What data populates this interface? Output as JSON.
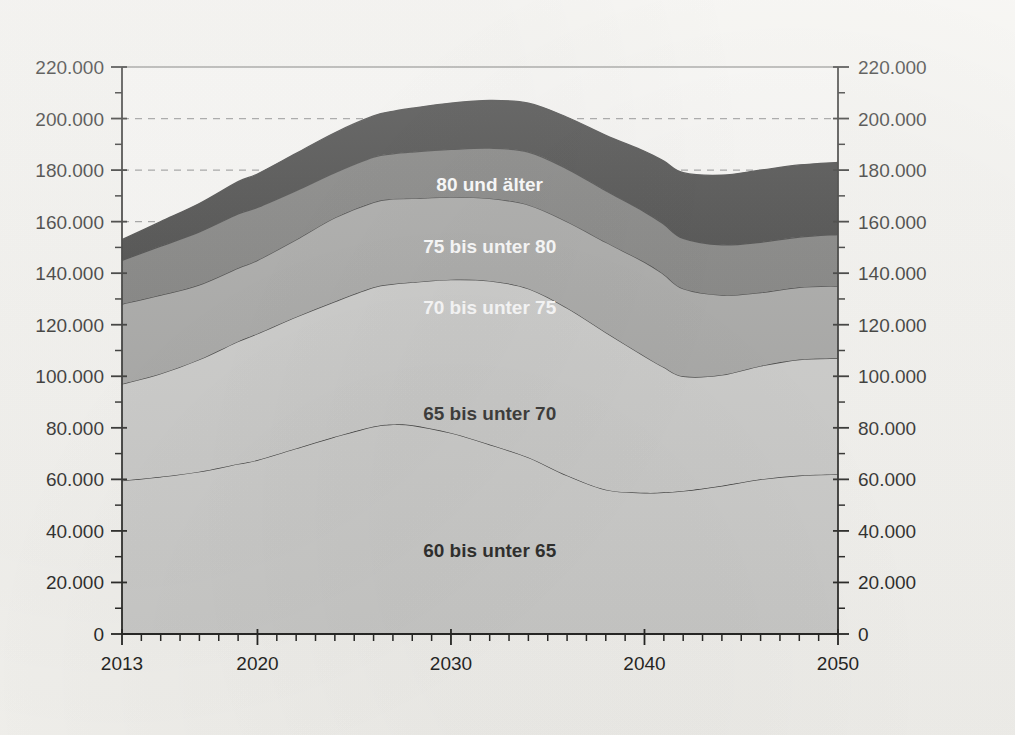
{
  "chart_data": {
    "type": "area",
    "stacked": true,
    "title": "",
    "subtitle": "",
    "xlabel": "",
    "ylabel": "",
    "xlim": [
      2013,
      2050
    ],
    "ylim": [
      0,
      220000
    ],
    "x_tick_labels": [
      "2013",
      "2020",
      "2030",
      "2040",
      "2050"
    ],
    "x_tick_values": [
      2013,
      2020,
      2030,
      2040,
      2050
    ],
    "x_minor_tick_step": 1,
    "y_tick_labels": [
      "0",
      "20.000",
      "40.000",
      "60.000",
      "80.000",
      "100.000",
      "120.000",
      "140.000",
      "160.000",
      "180.000",
      "200.000",
      "220.000"
    ],
    "y_tick_values": [
      0,
      20000,
      40000,
      60000,
      80000,
      100000,
      120000,
      140000,
      160000,
      180000,
      200000,
      220000
    ],
    "y_minor_tick_step": 10000,
    "y_axis_both_sides": true,
    "gridlines": {
      "visible_dashed_at": [
        160000,
        180000,
        200000
      ],
      "style": "dashed",
      "color": "#8f8f8f"
    },
    "legend": {
      "position": "inline-on-bands"
    },
    "x": [
      2013,
      2015,
      2017,
      2019,
      2020,
      2022,
      2024,
      2026,
      2027,
      2028,
      2030,
      2032,
      2034,
      2036,
      2038,
      2040,
      2041,
      2042,
      2044,
      2046,
      2048,
      2050
    ],
    "series": [
      {
        "name": "60 bis unter 65",
        "label": "60 bis unter 65",
        "color": "#c9c9c7",
        "label_color": "#1d1d1b",
        "values": [
          59500,
          61000,
          63000,
          66000,
          67500,
          72000,
          76500,
          80500,
          81300,
          81000,
          78000,
          73500,
          68500,
          61500,
          56000,
          54800,
          55000,
          55500,
          57500,
          60000,
          61500,
          62000
        ]
      },
      {
        "name": "65 bis unter 70",
        "label": "65 bis unter 70",
        "color": "#c6c6c4",
        "label_color": "#1d1d1b",
        "values": [
          37500,
          40000,
          43500,
          47500,
          49000,
          51000,
          52500,
          54000,
          54500,
          55500,
          59500,
          63500,
          65500,
          65000,
          61000,
          53000,
          48500,
          44500,
          43000,
          44000,
          45000,
          45000
        ]
      },
      {
        "name": "70 bis unter 75",
        "label": "70 bis unter 75",
        "color": "#9b9b99",
        "label_color": "#ffffff",
        "values": [
          31000,
          30500,
          29000,
          28500,
          28500,
          30000,
          32500,
          33000,
          33000,
          32500,
          32000,
          32000,
          32500,
          33500,
          35000,
          36500,
          36000,
          34000,
          31000,
          28500,
          28000,
          28000
        ]
      },
      {
        "name": "75 bis unter 80",
        "label": "75 bis unter 80",
        "color": "#6e6e6c",
        "label_color": "#ffffff",
        "values": [
          17000,
          19000,
          20500,
          21000,
          20500,
          19000,
          17500,
          17500,
          17500,
          18000,
          18500,
          19500,
          20500,
          20500,
          20000,
          19500,
          19500,
          19500,
          19500,
          19500,
          19500,
          20000
        ]
      },
      {
        "name": "80 und älter",
        "label": "80 und älter",
        "color": "#2b2b2a",
        "label_color": "#ffffff",
        "values": [
          8000,
          9500,
          11000,
          12500,
          13000,
          14500,
          15500,
          16000,
          16500,
          17000,
          18000,
          18500,
          19000,
          20000,
          21500,
          23500,
          24500,
          25500,
          27000,
          28000,
          28000,
          28000
        ]
      }
    ],
    "band_label_positions": [
      {
        "name": "60 bis unter 65",
        "x": 2032,
        "y": 30000
      },
      {
        "name": "65 bis unter 70",
        "x": 2032,
        "y": 83000
      },
      {
        "name": "70 bis unter 75",
        "x": 2032,
        "y": 124000
      },
      {
        "name": "75 bis unter 80",
        "x": 2032,
        "y": 148000
      },
      {
        "name": "80 und älter",
        "x": 2032,
        "y": 172000
      }
    ]
  },
  "style": {
    "background": "#f4f3ef",
    "plot_background": "#f7f6f3",
    "axis_color": "#1d1d1b",
    "gridline_color": "#8f8f8f",
    "band_outline_color": "#2b2b2a"
  }
}
